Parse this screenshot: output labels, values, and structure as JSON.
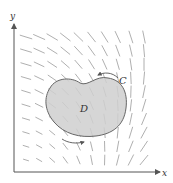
{
  "diagram": {
    "labels": {
      "x_axis": "x",
      "y_axis": "y",
      "region": "D",
      "curve": "C"
    },
    "orientation": "counterclockwise",
    "colors": {
      "axis": "#555555",
      "field_arrows": "#9a9a9a",
      "region_fill": "#cfcfcf",
      "region_stroke": "#666666",
      "labels": "#333333"
    },
    "vector_field": {
      "grid_columns": 10,
      "grid_rows": 10,
      "description": "field directed left-down in upper region, rotating to point upward near bottom-right"
    }
  }
}
